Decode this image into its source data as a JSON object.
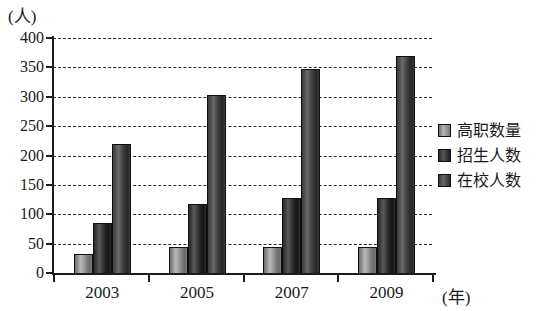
{
  "chart_data": {
    "type": "bar",
    "title": "",
    "subtitle": "",
    "xlabel": "(年)",
    "ylabel": "(人)",
    "categories": [
      "2003",
      "2005",
      "2007",
      "2009"
    ],
    "series": [
      {
        "name": "高职数量",
        "values": [
          32,
          44,
          45,
          45
        ],
        "color": "#9a9a9a"
      },
      {
        "name": "招生人数",
        "values": [
          85,
          118,
          128,
          128
        ],
        "color": "#2b2b2b"
      },
      {
        "name": "在校人数",
        "values": [
          220,
          303,
          348,
          370
        ],
        "color": "#4a4a4a"
      }
    ],
    "ylim": [
      0,
      400
    ],
    "yticks": [
      0,
      50,
      100,
      150,
      200,
      250,
      300,
      350,
      400
    ],
    "ytick_labels": [
      "0",
      "50",
      "100",
      "150",
      "200",
      "250",
      "300",
      "350",
      "400"
    ],
    "grid": true,
    "grid_style": "dashed-horizontal",
    "legend_position": "right"
  },
  "axis": {
    "y_unit_caption": "(人)",
    "x_unit_caption": "(年)"
  },
  "legend": {
    "items": [
      {
        "label": "高职数量"
      },
      {
        "label": "招生人数"
      },
      {
        "label": "在校人数"
      }
    ]
  }
}
